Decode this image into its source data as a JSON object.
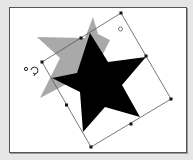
{
  "canvas": {
    "background": "#ffffff",
    "border_color": "#555555",
    "page_background": "#e6e6e6"
  },
  "shapes": {
    "ghost_star": {
      "label": "original-star-preview",
      "color": "#a9a9a9"
    },
    "star": {
      "label": "rotated-star",
      "color": "#000000"
    }
  },
  "selection": {
    "stroke_color": "#555555",
    "handle_color": "#111111",
    "handles": [
      "top",
      "top-right-mid",
      "right",
      "bottom-right-mid",
      "bottom",
      "bottom-left-mid",
      "left",
      "top-left-mid"
    ]
  },
  "icons": {
    "rotate": "rotate-cursor-icon",
    "center_point": "rotation-center-icon"
  }
}
